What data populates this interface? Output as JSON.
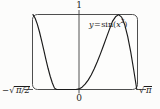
{
  "figure": {
    "name": "graph-of-y-equals-sin-x-squared",
    "background_color": "#fcfcfb",
    "frame_color": "#3a3a3a",
    "curve_color": "#1a1a1a",
    "axis_color": "#3a3a3a"
  },
  "labels": {
    "y_max": "1",
    "origin": "0",
    "x_min_minus": "−",
    "x_min_radicand": "π/2",
    "x_max_radicand": "π",
    "curve_y": "y",
    "curve_equals": "=",
    "curve_fn": "sin(",
    "curve_var": "x",
    "curve_exp": "2",
    "curve_close": ")"
  },
  "chart_data": {
    "type": "line",
    "title": "",
    "xlabel": "",
    "ylabel": "",
    "equation": "y = sin(x^2)",
    "legend": [
      "y = sin(x²)"
    ],
    "legend_position": "inside-top-right",
    "grid": false,
    "xlim": [
      -1.2533141373155,
      1.7724538509055
    ],
    "ylim": [
      0,
      1
    ],
    "xticks": [
      -1.2533141373155,
      0,
      1.7724538509055
    ],
    "xticklabels": [
      "−√(π/2)",
      "0",
      "√π"
    ],
    "yticks": [
      0,
      1
    ],
    "yticklabels": [
      "0",
      "1"
    ],
    "annotations": [
      {
        "text": "1",
        "position": "top-center-above-frame"
      },
      {
        "text": "0",
        "position": "bottom-center-below-frame"
      },
      {
        "text": "−√(π/2)",
        "position": "bottom-left-outside"
      },
      {
        "text": "√π",
        "position": "bottom-right-outside"
      },
      {
        "text": "y = sin(x²)",
        "position": "inside-upper-right"
      }
    ],
    "x": [
      -1.2533141,
      -1.1906484,
      -1.1279827,
      -1.065317,
      -1.0026513,
      -0.9399856,
      -0.8773199,
      -0.8146542,
      -0.7519885,
      -0.6893228,
      -0.6266571,
      -0.5639914,
      -0.5013257,
      -0.43866,
      -0.3759942,
      -0.3133285,
      -0.2506628,
      -0.1879971,
      -0.1253314,
      -0.0626657,
      0,
      0.0886227,
      0.1772454,
      0.2658681,
      0.3544908,
      0.4431135,
      0.5317362,
      0.6203589,
      0.7089815,
      0.7976042,
      0.8862269,
      0.9748496,
      1.0634723,
      1.152095,
      1.2407177,
      1.3293404,
      1.4179631,
      1.5065858,
      1.5952085,
      1.6838312,
      1.7724539
    ],
    "y": [
      1.0,
      0.9505,
      0.8723,
      0.7711,
      0.654,
      0.5287,
      0.4028,
      0.2834,
      0.1766,
      0.0871,
      0.0183,
      0.0,
      0.0,
      0.0,
      0.0,
      0.0,
      0.0,
      0.0,
      0.0,
      0.0,
      0.0,
      0.0078,
      0.0314,
      0.0706,
      0.1251,
      0.1941,
      0.2762,
      0.3696,
      0.472,
      0.5806,
      0.6923,
      0.8034,
      0.9096,
      0.9705,
      0.9998,
      0.9663,
      0.8684,
      0.7102,
      0.5012,
      0.2572,
      0.0
    ],
    "curve_note": "U-shaped: starts at y=1 at left edge, descends to 0 at x=0, rises back to 1 at right edge"
  }
}
